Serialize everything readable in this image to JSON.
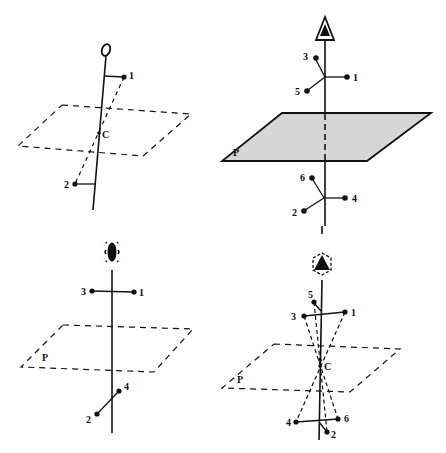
{
  "figure": {
    "panels": [
      {
        "id": "top-left",
        "symmetry_element": "inversion-center",
        "axis_symbol": "ellipse-open",
        "center_label": "C",
        "atom_labels": [
          "1",
          "2"
        ]
      },
      {
        "id": "top-right",
        "symmetry_element": "threefold-axis-with-mirror-plane",
        "axis_symbol": "triangle-filled-in-triangle",
        "plane_label": "P",
        "atom_labels": [
          "3",
          "1",
          "5",
          "6",
          "4",
          "2"
        ]
      },
      {
        "id": "bottom-left",
        "symmetry_element": "fourfold-rotoinversion",
        "axis_symbol": "filled-lens-in-dashed-square",
        "plane_label": "P",
        "atom_labels": [
          "3",
          "1",
          "4",
          "2"
        ]
      },
      {
        "id": "bottom-right",
        "symmetry_element": "sixfold-rotoinversion",
        "axis_symbol": "triangle-in-dashed-hexagon",
        "plane_label": "P",
        "center_label": "C",
        "atom_labels": [
          "5",
          "3",
          "1",
          "4",
          "6",
          "2"
        ]
      }
    ]
  },
  "labels": {
    "c_tl": "C",
    "a1_tl": "1",
    "a2_tl": "2",
    "p_tr": "P",
    "a3_tr": "3",
    "a1_tr": "1",
    "a5_tr": "5",
    "a6_tr": "6",
    "a4_tr": "4",
    "a2_tr": "2",
    "p_bl": "P",
    "a3_bl": "3",
    "a1_bl": "1",
    "a4_bl": "4",
    "a2_bl": "2",
    "p_br": "P",
    "c_br": "C",
    "a5_br": "5",
    "a3_br": "3",
    "a1_br": "1",
    "a4_br": "4",
    "a6_br": "6",
    "a2_br": "2"
  }
}
